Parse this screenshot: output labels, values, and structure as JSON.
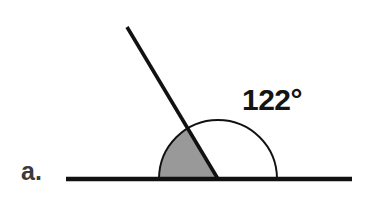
{
  "figure": {
    "canvas": {
      "width": 370,
      "height": 202,
      "background_color": "#ffffff"
    },
    "part_label": {
      "text": "a.",
      "x": 21,
      "y": 180,
      "color": "#3a3a3a"
    },
    "angle_label": {
      "text": "122°",
      "x": 242,
      "y": 110,
      "color": "#141414"
    },
    "baseline": {
      "x1": 66,
      "y1": 179,
      "x2": 352,
      "y2": 179,
      "stroke_width": 4.4,
      "color": "#111111"
    },
    "ray": {
      "x1": 218,
      "y1": 179,
      "x2": 127,
      "y2": 27,
      "stroke_width": 3.6,
      "color": "#111111"
    },
    "vertex": {
      "x": 218,
      "y": 179
    },
    "arc": {
      "radius": 59,
      "start_angle_deg": 0,
      "end_angle_deg": 180,
      "stroke_width": 1.9,
      "color": "#111111",
      "path": "M 277 179 A 59 59 0 0 0 159 179"
    },
    "shaded_sector": {
      "fill_color": "#999999",
      "start_angle_deg": 122,
      "end_angle_deg": 180,
      "radius": 59,
      "path": "M 218 179 L 186.73 128.97 A 59 59 0 0 0 159 179 Z"
    }
  },
  "chart_data": {
    "type": "diagram",
    "title": "",
    "measurement": {
      "label": "122°",
      "value": 122,
      "unit": "degrees"
    },
    "part": "a."
  }
}
